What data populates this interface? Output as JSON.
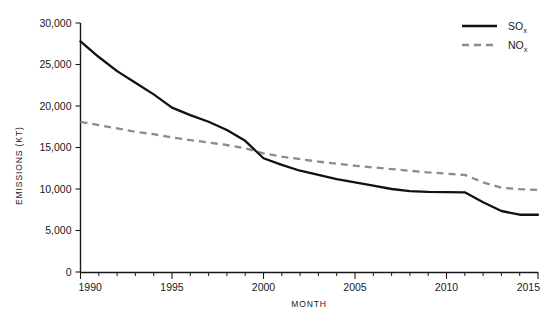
{
  "chart_data": {
    "type": "line",
    "title": "",
    "xlabel": "MONTH",
    "ylabel": "EMISSIONS (KT)",
    "xlim": [
      1990,
      2015
    ],
    "ylim": [
      0,
      30000
    ],
    "grid": false,
    "legend_position": "top-right",
    "x_tick_labels": [
      "1990",
      "1995",
      "2000",
      "2005",
      "2010",
      "2015"
    ],
    "x_major_ticks": [
      1990,
      1995,
      2000,
      2005,
      2010,
      2015
    ],
    "x_minor_tick_interval": 1,
    "y_tick_labels": [
      "0",
      "5,000",
      "10,000",
      "15,000",
      "20,000",
      "25,000",
      "30,000"
    ],
    "y_ticks": [
      0,
      5000,
      10000,
      15000,
      20000,
      25000,
      30000
    ],
    "x": [
      1990,
      1991,
      1992,
      1993,
      1994,
      1995,
      1996,
      1997,
      1998,
      1999,
      2000,
      2001,
      2002,
      2003,
      2004,
      2005,
      2006,
      2007,
      2008,
      2009,
      2010,
      2011,
      2012,
      2013,
      2014,
      2015
    ],
    "series": [
      {
        "name": "SOx",
        "color": "#111111",
        "style": "solid",
        "values": [
          27800,
          25900,
          24200,
          22800,
          21400,
          19800,
          18900,
          18100,
          17100,
          15800,
          13700,
          12900,
          12200,
          11700,
          11200,
          10800,
          10400,
          10000,
          9750,
          9650,
          9620,
          9600,
          8400,
          7350,
          6900,
          6900
        ]
      },
      {
        "name": "NOx",
        "color": "#8c8c8c",
        "style": "dashed",
        "values": [
          18100,
          17700,
          17300,
          16900,
          16600,
          16200,
          15900,
          15600,
          15300,
          14900,
          14300,
          13900,
          13600,
          13300,
          13050,
          12800,
          12600,
          12400,
          12200,
          12000,
          11850,
          11700,
          10800,
          10150,
          9980,
          9900
        ]
      }
    ],
    "annotations": {
      "crossover_year": 1999.6,
      "crossover_value": 14900
    }
  },
  "legend": {
    "items": [
      {
        "base": "SO",
        "sub": "x",
        "swatch": "solid-line-black"
      },
      {
        "base": "NO",
        "sub": "x",
        "swatch": "dashed-line-gray"
      }
    ]
  },
  "colors": {
    "sox": "#111111",
    "nox": "#8c8c8c",
    "axis": "#1a1a1a",
    "background": "#ffffff"
  }
}
